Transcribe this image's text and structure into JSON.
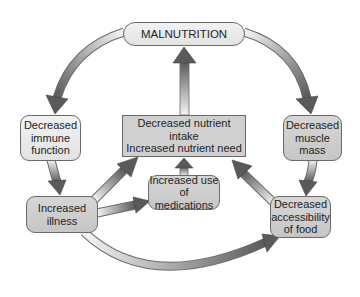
{
  "diagram": {
    "nodes": {
      "malnutrition": "MALNUTRITION",
      "immune": "Decreased\nimmune\nfunction",
      "center": "Decreased nutrient intake\nIncreased nutrient need",
      "muscle": "Decreased\nmuscle\nmass",
      "medications": "Increased use\nof medications",
      "illness": "Increased\nillness",
      "access": "Decreased\naccessibility\nof food"
    },
    "edges": [
      {
        "from": "malnutrition",
        "to": "immune"
      },
      {
        "from": "malnutrition",
        "to": "muscle"
      },
      {
        "from": "center",
        "to": "malnutrition"
      },
      {
        "from": "immune",
        "to": "illness"
      },
      {
        "from": "muscle",
        "to": "access"
      },
      {
        "from": "illness",
        "to": "center"
      },
      {
        "from": "illness",
        "to": "medications"
      },
      {
        "from": "medications",
        "to": "center"
      },
      {
        "from": "access",
        "to": "center"
      },
      {
        "from": "illness",
        "to": "access"
      }
    ],
    "colors": {
      "arrow_light": "#f4f4f4",
      "arrow_dark": "#5a5a5a",
      "node_fill": "#cfcfcf",
      "node_border": "#6a6a6a"
    }
  }
}
